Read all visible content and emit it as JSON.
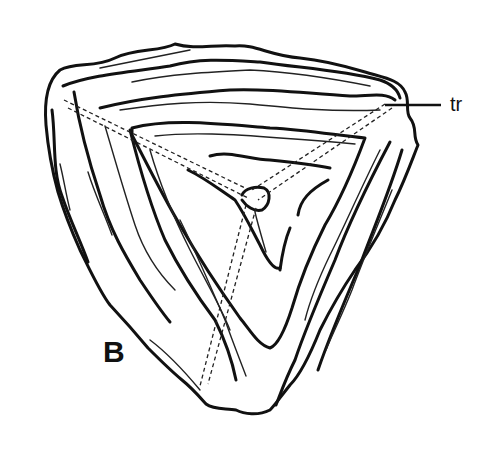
{
  "figure": {
    "panel_label": "B",
    "annotations": [
      {
        "id": "tr",
        "text": "tr"
      }
    ],
    "colors": {
      "line": "#111111",
      "background": "#ffffff"
    }
  }
}
